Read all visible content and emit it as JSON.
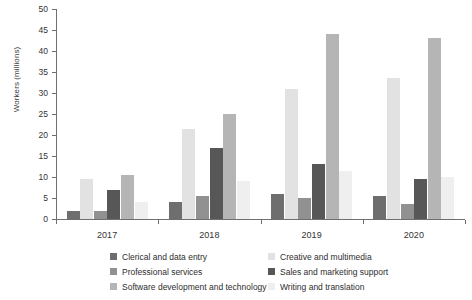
{
  "chart_data": {
    "type": "bar",
    "title": "",
    "xlabel": "",
    "ylabel": "Workers (millions)",
    "categories": [
      "2017",
      "2018",
      "2019",
      "2020"
    ],
    "ylim": [
      0,
      50
    ],
    "yticks": [
      0,
      5,
      10,
      15,
      20,
      25,
      30,
      35,
      40,
      45,
      50
    ],
    "grid": false,
    "legend_position": "bottom",
    "series": [
      {
        "name": "Clerical and data entry",
        "color": "#6e6e6e",
        "values": [
          2,
          4,
          6,
          5.5
        ]
      },
      {
        "name": "Creative and multimedia",
        "color": "#e2e2e2",
        "values": [
          9.5,
          21.5,
          31,
          33.5
        ]
      },
      {
        "name": "Professional services",
        "color": "#919191",
        "values": [
          2,
          5.5,
          5,
          3.5
        ]
      },
      {
        "name": "Sales and marketing support",
        "color": "#575757",
        "values": [
          7,
          17,
          13,
          9.5
        ]
      },
      {
        "name": "Software development and technology",
        "color": "#b5b5b5",
        "values": [
          10.5,
          25,
          44,
          43
        ]
      },
      {
        "name": "Writing and translation",
        "color": "#efefef",
        "values": [
          4,
          9,
          11.5,
          10
        ]
      }
    ]
  },
  "legend": {
    "left_column": [
      "Clerical and data entry",
      "Professional services",
      "Software development and technology"
    ],
    "right_column": [
      "Creative and multimedia",
      "Sales and marketing support",
      "Writing and translation"
    ]
  }
}
